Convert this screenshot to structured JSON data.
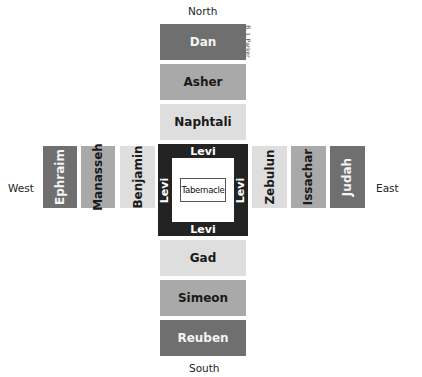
{
  "directions": {
    "north": "North",
    "south": "South",
    "east": "East",
    "west": "West"
  },
  "credit": "B. J. Parker",
  "north_tribes": [
    {
      "name": "Dan",
      "shade": "dark"
    },
    {
      "name": "Asher",
      "shade": "mid"
    },
    {
      "name": "Naphtali",
      "shade": "light"
    }
  ],
  "south_tribes": [
    {
      "name": "Gad",
      "shade": "light"
    },
    {
      "name": "Simeon",
      "shade": "mid"
    },
    {
      "name": "Reuben",
      "shade": "dark"
    }
  ],
  "west_tribes": [
    {
      "name": "Ephraim",
      "shade": "dark"
    },
    {
      "name": "Manasseh",
      "shade": "mid"
    },
    {
      "name": "Benjamin",
      "shade": "light"
    }
  ],
  "east_tribes": [
    {
      "name": "Zebulun",
      "shade": "light"
    },
    {
      "name": "Issachar",
      "shade": "mid"
    },
    {
      "name": "Judah",
      "shade": "dark"
    }
  ],
  "center": {
    "levi_top": "Levi",
    "levi_bottom": "Levi",
    "levi_left": "Levi",
    "levi_right": "Levi",
    "tabernacle": "Tabernacle"
  },
  "colors": {
    "dark": "#6f6f6f",
    "mid": "#a9a9a9",
    "light": "#dedede",
    "center": "#232323"
  }
}
